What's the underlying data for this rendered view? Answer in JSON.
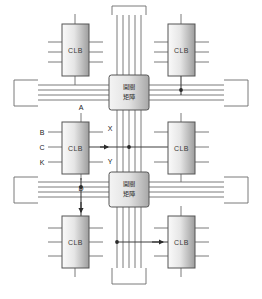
{
  "diagram": {
    "colors": {
      "line": "#6b6b6b",
      "line_dark": "#3f3f3f",
      "block_fill_light": "#f2f2f2",
      "block_fill_dark": "#9a9a9a",
      "block_border": "#555555",
      "text": "#2b2b2b",
      "junction": "#2b2b2b",
      "background": "#ffffff"
    },
    "blocks": {
      "clb_label": "CLB",
      "switch_matrix_line1": "開關",
      "switch_matrix_line2": "矩陣"
    },
    "clbs": [
      {
        "id": "clb-top-left",
        "label": "CLB",
        "x": 62,
        "y": 24
      },
      {
        "id": "clb-top-right",
        "label": "CLB",
        "x": 168,
        "y": 24
      },
      {
        "id": "clb-center-left",
        "label": "CLB",
        "x": 62,
        "y": 122
      },
      {
        "id": "clb-center-right",
        "label": "CLB",
        "x": 168,
        "y": 122
      },
      {
        "id": "clb-bottom-left",
        "label": "CLB",
        "x": 62,
        "y": 216
      },
      {
        "id": "clb-bottom-right",
        "label": "CLB",
        "x": 168,
        "y": 216
      }
    ],
    "switch_matrices": [
      {
        "id": "switch-matrix-top",
        "line1": "開關",
        "line2": "矩陣",
        "x": 109,
        "y": 75
      },
      {
        "id": "switch-matrix-bottom",
        "line1": "開關",
        "line2": "矩陣",
        "x": 109,
        "y": 172
      }
    ],
    "pins": [
      {
        "name": "A",
        "label": "A",
        "side": "top",
        "x": 81,
        "y": 110
      },
      {
        "name": "B",
        "label": "B",
        "side": "left",
        "x": 42,
        "y": 130
      },
      {
        "name": "C",
        "label": "C",
        "side": "left",
        "x": 42,
        "y": 146
      },
      {
        "name": "K",
        "label": "K",
        "side": "left",
        "x": 42,
        "y": 162
      },
      {
        "name": "X",
        "label": "X",
        "side": "right",
        "x": 110,
        "y": 131
      },
      {
        "name": "Y",
        "label": "Y",
        "side": "right",
        "x": 110,
        "y": 160
      },
      {
        "name": "D",
        "label": "D",
        "side": "bottom",
        "x": 81,
        "y": 177
      }
    ],
    "buses": {
      "vertical_line_count": 5,
      "horizontal_line_count": 4
    },
    "io_pads": [
      {
        "id": "io-pad-left-top",
        "edge": "left"
      },
      {
        "id": "io-pad-right-top",
        "edge": "right"
      },
      {
        "id": "io-pad-left-bottom",
        "edge": "left"
      },
      {
        "id": "io-pad-right-bottom",
        "edge": "right"
      },
      {
        "id": "io-pad-top",
        "edge": "top"
      },
      {
        "id": "io-pad-bottom",
        "edge": "bottom"
      }
    ]
  }
}
